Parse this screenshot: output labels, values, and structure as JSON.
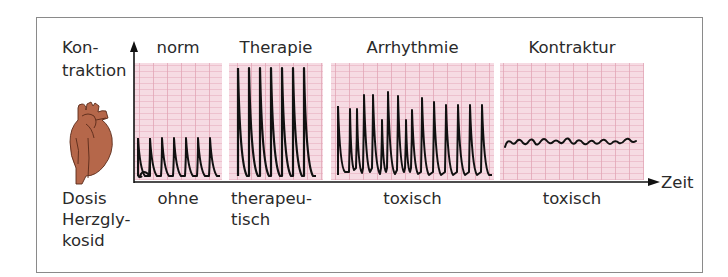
{
  "y_axis_label": [
    "Kon-",
    "traktion"
  ],
  "x_axis_label": "Zeit",
  "row_label": [
    "Dosis",
    "Herzgly-",
    "kosid"
  ],
  "icon": "heart-icon",
  "colors": {
    "grid_background": "#f6dbe3",
    "grid_line": "#e9b6c4",
    "trace": "#111111",
    "heart": "#b5674a",
    "heart_outline": "#5a2a1a",
    "frame": "#8a8a8a"
  },
  "panels": [
    {
      "title": "norm",
      "dose": [
        "ohne"
      ]
    },
    {
      "title": "Therapie",
      "dose": [
        "therapeu-",
        "tisch"
      ]
    },
    {
      "title": "Arrhythmie",
      "dose": [
        "toxisch"
      ]
    },
    {
      "title": "Kontraktur",
      "dose": [
        "toxisch"
      ]
    }
  ]
}
